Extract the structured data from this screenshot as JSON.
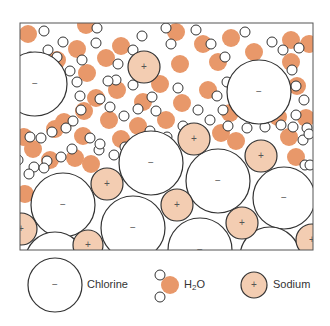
{
  "frame": {
    "x": 20,
    "y": 23,
    "width": 293,
    "height": 227,
    "stroke": "#555555"
  },
  "colors": {
    "water": "#e8986a",
    "sodium_fill": "#f3cdb2",
    "chlorine_fill": "#ffffff",
    "stroke": "#333333",
    "hydrogen_fill": "#ffffff"
  },
  "chlorine": [
    {
      "cx": 35,
      "cy": 84,
      "r": 32
    },
    {
      "cx": 259,
      "cy": 92,
      "r": 32
    },
    {
      "cx": 151,
      "cy": 163,
      "r": 32
    },
    {
      "cx": 63,
      "cy": 205,
      "r": 32
    },
    {
      "cx": 218,
      "cy": 181,
      "r": 32
    },
    {
      "cx": 284,
      "cy": 198,
      "r": 31
    },
    {
      "cx": 133,
      "cy": 228,
      "r": 32
    },
    {
      "cx": 200,
      "cy": 250,
      "r": 32
    },
    {
      "cx": 270,
      "cy": 257,
      "r": 30
    },
    {
      "cx": 55,
      "cy": 262,
      "r": 30
    }
  ],
  "sodium": [
    {
      "cx": 144,
      "cy": 67,
      "r": 16
    },
    {
      "cx": 107,
      "cy": 184,
      "r": 16
    },
    {
      "cx": 194,
      "cy": 139,
      "r": 16
    },
    {
      "cx": 261,
      "cy": 156,
      "r": 16
    },
    {
      "cx": 21,
      "cy": 229,
      "r": 16
    },
    {
      "cx": 88,
      "cy": 245,
      "r": 15
    },
    {
      "cx": 177,
      "cy": 205,
      "r": 16
    },
    {
      "cx": 242,
      "cy": 223,
      "r": 16
    },
    {
      "cx": 312,
      "cy": 240,
      "r": 16
    }
  ],
  "water": [
    [
      28,
      34
    ],
    [
      86,
      25
    ],
    [
      77,
      49
    ],
    [
      57,
      60
    ],
    [
      106,
      58
    ],
    [
      87,
      73
    ],
    [
      121,
      46
    ],
    [
      176,
      32
    ],
    [
      203,
      44
    ],
    [
      218,
      62
    ],
    [
      231,
      38
    ],
    [
      254,
      52
    ],
    [
      291,
      40
    ],
    [
      309,
      44
    ],
    [
      180,
      64
    ],
    [
      160,
      84
    ],
    [
      117,
      90
    ],
    [
      96,
      98
    ],
    [
      84,
      111
    ],
    [
      143,
      102
    ],
    [
      182,
      103
    ],
    [
      208,
      90
    ],
    [
      230,
      113
    ],
    [
      250,
      98
    ],
    [
      291,
      62
    ],
    [
      297,
      86
    ],
    [
      306,
      118
    ],
    [
      64,
      122
    ],
    [
      83,
      136
    ],
    [
      109,
      120
    ],
    [
      166,
      120
    ],
    [
      138,
      126
    ],
    [
      121,
      139
    ],
    [
      75,
      158
    ],
    [
      50,
      160
    ],
    [
      33,
      149
    ],
    [
      24,
      137
    ],
    [
      55,
      129
    ],
    [
      278,
      117
    ],
    [
      289,
      137
    ],
    [
      296,
      157
    ],
    [
      221,
      133
    ],
    [
      236,
      141
    ],
    [
      25,
      194
    ],
    [
      91,
      164
    ]
  ],
  "hydrogen": [
    [
      44,
      31
    ],
    [
      63,
      42
    ],
    [
      97,
      28
    ],
    [
      96,
      43
    ],
    [
      82,
      60
    ],
    [
      77,
      82
    ],
    [
      118,
      64
    ],
    [
      116,
      80
    ],
    [
      133,
      50
    ],
    [
      142,
      36
    ],
    [
      166,
      28
    ],
    [
      171,
      44
    ],
    [
      196,
      30
    ],
    [
      211,
      44
    ],
    [
      225,
      57
    ],
    [
      245,
      32
    ],
    [
      272,
      42
    ],
    [
      283,
      50
    ],
    [
      299,
      48
    ],
    [
      239,
      77
    ],
    [
      248,
      71
    ],
    [
      227,
      82
    ],
    [
      292,
      70
    ],
    [
      296,
      86
    ],
    [
      304,
      100
    ],
    [
      296,
      115
    ],
    [
      307,
      128
    ],
    [
      22,
      62
    ],
    [
      30,
      57
    ],
    [
      48,
      50
    ],
    [
      57,
      57
    ],
    [
      70,
      71
    ],
    [
      80,
      96
    ],
    [
      81,
      110
    ],
    [
      73,
      121
    ],
    [
      66,
      128
    ],
    [
      52,
      132
    ],
    [
      41,
      138
    ],
    [
      30,
      137
    ],
    [
      108,
      81
    ],
    [
      100,
      99
    ],
    [
      110,
      107
    ],
    [
      133,
      85
    ],
    [
      138,
      109
    ],
    [
      124,
      116
    ],
    [
      152,
      97
    ],
    [
      156,
      111
    ],
    [
      178,
      88
    ],
    [
      198,
      110
    ],
    [
      210,
      120
    ],
    [
      223,
      110
    ],
    [
      217,
      96
    ],
    [
      228,
      126
    ],
    [
      247,
      128
    ],
    [
      265,
      127
    ],
    [
      281,
      125
    ],
    [
      293,
      127
    ],
    [
      303,
      140
    ],
    [
      309,
      134
    ],
    [
      150,
      131
    ],
    [
      167,
      137
    ],
    [
      183,
      126
    ],
    [
      34,
      167
    ],
    [
      47,
      161
    ],
    [
      61,
      157
    ],
    [
      72,
      149
    ],
    [
      90,
      138
    ],
    [
      99,
      150
    ],
    [
      114,
      155
    ],
    [
      125,
      147
    ],
    [
      136,
      148
    ],
    [
      143,
      160
    ],
    [
      305,
      165
    ],
    [
      310,
      165
    ],
    [
      29,
      174
    ],
    [
      18,
      160
    ],
    [
      44,
      168
    ],
    [
      100,
      144
    ]
  ],
  "legend": {
    "chlorine": {
      "label": "Chlorine",
      "cx": 55,
      "cy": 285,
      "r": 27,
      "symbol": "−"
    },
    "water": {
      "label_main": "H",
      "label_sub": "2",
      "label_end": "O",
      "cx": 170,
      "cy": 285
    },
    "sodium": {
      "label": "Sodium",
      "cx": 254,
      "cy": 285,
      "r": 13,
      "symbol": "+"
    }
  },
  "symbols": {
    "chlorine": "−",
    "sodium": "+"
  }
}
